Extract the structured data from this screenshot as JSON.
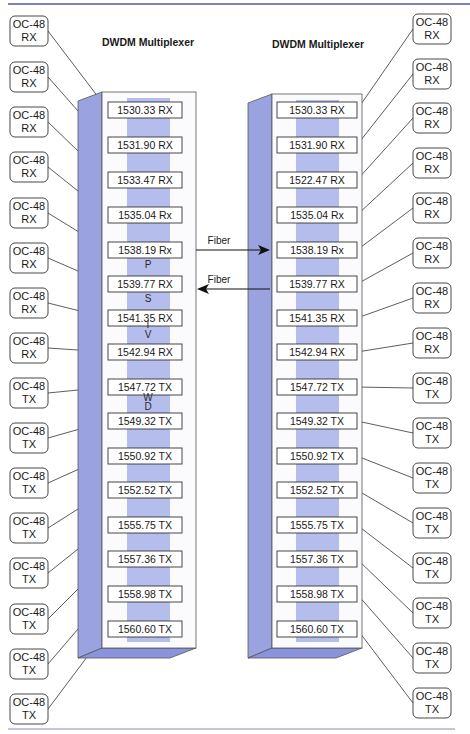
{
  "colors": {
    "rule": "#7b80c8",
    "side_panel": "#9aa3e0",
    "stripe": "#b4bdec",
    "bottom_face": "#8a94da",
    "line": "#333333",
    "box_border": "#333333"
  },
  "left_mux": {
    "title": "DWDM Multiplexer",
    "channels": [
      "1530.33 RX",
      "1531.90 RX",
      "1533.47 RX",
      "1535.04 Rx",
      "1538.19 Rx",
      "1539.77 RX",
      "1541.35 RX",
      "1542.94 RX",
      "1547.72 TX",
      "1549.32 TX",
      "1550.92 TX",
      "1552.52 TX",
      "1555.75 TX",
      "1557.36 TX",
      "1558.98 TX",
      "1560.60 TX"
    ],
    "vertical_letters": [
      "P",
      "S",
      "I",
      "V",
      "W",
      "D"
    ]
  },
  "right_mux": {
    "title": "DWDM Multiplexer",
    "channels": [
      "1530.33 RX",
      "1531.90 RX",
      "1522.47 RX",
      "1535.04 Rx",
      "1538.19 Rx",
      "1539.77 RX",
      "1541.35 RX",
      "1542.94 RX",
      "1547.72 TX",
      "1549.32 TX",
      "1550.92 TX",
      "1552.52 TX",
      "1555.75 TX",
      "1557.36 TX",
      "1558.98 TX",
      "1560.60 TX"
    ]
  },
  "left_terminals": [
    {
      "line1": "OC-48",
      "line2": "RX"
    },
    {
      "line1": "OC-48",
      "line2": "RX"
    },
    {
      "line1": "OC-48",
      "line2": "RX"
    },
    {
      "line1": "OC-48",
      "line2": "RX"
    },
    {
      "line1": "OC-48",
      "line2": "RX"
    },
    {
      "line1": "OC-48",
      "line2": "RX"
    },
    {
      "line1": "OC-48",
      "line2": "RX"
    },
    {
      "line1": "OC-48",
      "line2": "RX"
    },
    {
      "line1": "OC-48",
      "line2": "TX"
    },
    {
      "line1": "OC-48",
      "line2": "TX"
    },
    {
      "line1": "OC-48",
      "line2": "TX"
    },
    {
      "line1": "OC-48",
      "line2": "TX"
    },
    {
      "line1": "OC-48",
      "line2": "TX"
    },
    {
      "line1": "OC-48",
      "line2": "TX"
    },
    {
      "line1": "OC-48",
      "line2": "TX"
    },
    {
      "line1": "OC-48",
      "line2": "TX"
    }
  ],
  "right_terminals": [
    {
      "line1": "OC-48",
      "line2": "RX"
    },
    {
      "line1": "OC-48",
      "line2": "RX"
    },
    {
      "line1": "OC-48",
      "line2": "RX"
    },
    {
      "line1": "OC-48",
      "line2": "RX"
    },
    {
      "line1": "OC-48",
      "line2": "RX"
    },
    {
      "line1": "OC-48",
      "line2": "RX"
    },
    {
      "line1": "OC-48",
      "line2": "RX"
    },
    {
      "line1": "OC-48",
      "line2": "RX"
    },
    {
      "line1": "OC-48",
      "line2": "TX"
    },
    {
      "line1": "OC-48",
      "line2": "TX"
    },
    {
      "line1": "OC-48",
      "line2": "TX"
    },
    {
      "line1": "OC-48",
      "line2": "TX"
    },
    {
      "line1": "OC-48",
      "line2": "TX"
    },
    {
      "line1": "OC-48",
      "line2": "TX"
    },
    {
      "line1": "OC-48",
      "line2": "TX"
    },
    {
      "line1": "OC-48",
      "line2": "TX"
    }
  ],
  "links": [
    {
      "label": "Fiber",
      "direction": "left-to-right"
    },
    {
      "label": "Fiber",
      "direction": "right-to-left"
    }
  ]
}
